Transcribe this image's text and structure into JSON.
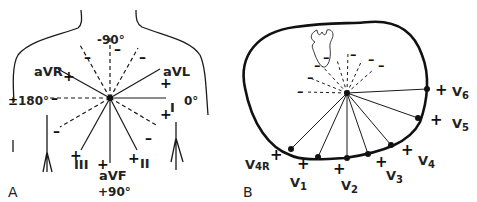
{
  "panel_a": {
    "letter": "A",
    "title": "Frontal plane (hexaxial) limb leads",
    "angles": {
      "top": "-90°",
      "left": "180°",
      "left_sign": "±",
      "right": "0°",
      "bottom": "+90°"
    },
    "leads": [
      {
        "name": "I",
        "angle_deg": 0,
        "positive": "+",
        "negative": ""
      },
      {
        "name": "aVL",
        "angle_deg": -30,
        "positive": "+",
        "negative": ""
      },
      {
        "name": "aVR",
        "angle_deg": -150,
        "positive": "+",
        "negative": ""
      },
      {
        "name": "II",
        "angle_deg": 60,
        "positive": "+",
        "negative": "–"
      },
      {
        "name": "aVF",
        "angle_deg": 90,
        "positive": "+",
        "negative": "–"
      },
      {
        "name": "III",
        "angle_deg": 120,
        "positive": "+",
        "negative": "–"
      }
    ],
    "labels": {
      "aVR": "aVR",
      "aVL": "aVL",
      "I": "I",
      "II": "II",
      "III": "III",
      "aVF": "aVF"
    },
    "signs": {
      "plus": "+",
      "minus": "–"
    }
  },
  "panel_b": {
    "letter": "B",
    "title": "Horizontal plane precordial leads",
    "leads": [
      {
        "name": "V4R",
        "base": "V",
        "sub": "4R"
      },
      {
        "name": "V1",
        "base": "V",
        "sub": "1"
      },
      {
        "name": "V2",
        "base": "V",
        "sub": "2"
      },
      {
        "name": "V3",
        "base": "V",
        "sub": "3"
      },
      {
        "name": "V4",
        "base": "V",
        "sub": "4"
      },
      {
        "name": "V5",
        "base": "V",
        "sub": "5"
      },
      {
        "name": "V6",
        "base": "V",
        "sub": "6"
      }
    ],
    "signs": {
      "plus": "+",
      "minus": "–"
    }
  },
  "colors": {
    "line": "#1a1a1a",
    "background": "#ffffff"
  }
}
